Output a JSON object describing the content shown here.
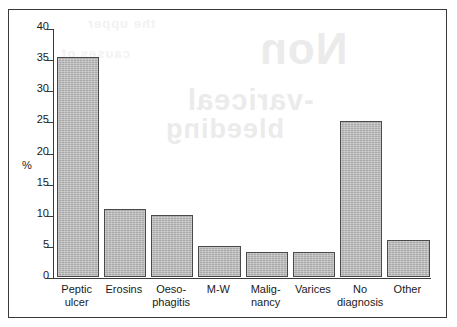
{
  "chart_data": {
    "type": "bar",
    "title": "",
    "subtitle": "",
    "xlabel": "",
    "ylabel": "%",
    "ylim": [
      0,
      40
    ],
    "ytick_step": 5,
    "yticks": [
      40,
      35,
      30,
      25,
      20,
      15,
      10,
      5,
      0
    ],
    "grid": false,
    "legend": null,
    "categories": [
      "Peptic ulcer",
      "Erosins",
      "Oeso-phagitis",
      "M-W",
      "Malig-nancy",
      "Varices",
      "No diagnosis",
      "Other"
    ],
    "category_lines": [
      [
        "Peptic",
        "ulcer"
      ],
      [
        "Erosins",
        ""
      ],
      [
        "Oeso-",
        "phagitis"
      ],
      [
        "M-W",
        ""
      ],
      [
        "Malig-",
        "nancy"
      ],
      [
        "Varices",
        ""
      ],
      [
        "No",
        "diagnosis"
      ],
      [
        "Other",
        ""
      ]
    ],
    "values": [
      35.3,
      11,
      10,
      5,
      4,
      4,
      25,
      6
    ],
    "bar_color": "#a9a9a9",
    "bar_edge_color": "#4a4a4a",
    "axis_color": "#3a3a3a",
    "background_color": "#ffffff"
  },
  "figure": {
    "border_color": "#3a3a3a"
  },
  "bleed_through": {
    "line_1": "Non",
    "line_2": "-variceal",
    "line_3": "bleeding",
    "line_4": "the upper",
    "line_5": "causes of"
  }
}
